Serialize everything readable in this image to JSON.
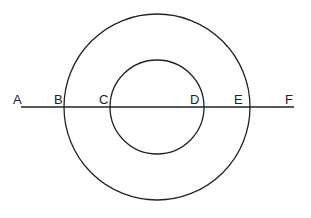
{
  "diagram": {
    "circles": [
      {
        "name": "outer-circle",
        "cx": 157,
        "cy": 107,
        "r": 93
      },
      {
        "name": "inner-circle",
        "cx": 157,
        "cy": 107,
        "r": 47
      }
    ],
    "line": {
      "x1": 21,
      "y1": 107,
      "x2": 294,
      "y2": 107
    },
    "labels": {
      "A": "A",
      "B": "B",
      "C": "C",
      "D": "D",
      "E": "E",
      "F": "F"
    },
    "colors": {
      "stroke": "#222222",
      "background": "#ffffff"
    }
  }
}
